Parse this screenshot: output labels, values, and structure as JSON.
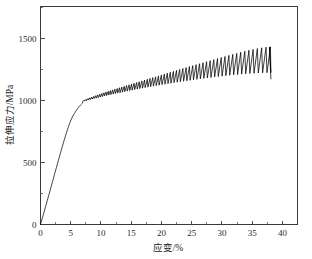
{
  "chart_data": {
    "type": "line",
    "title": "",
    "xlabel": "应变/%",
    "ylabel": "拉伸应力/MPa",
    "xlim": [
      0,
      42.5
    ],
    "ylim": [
      0,
      1760
    ],
    "xticks": [
      0,
      5,
      10,
      15,
      20,
      25,
      30,
      35,
      40
    ],
    "xticklabels": [
      "0",
      "5",
      "10",
      "15",
      "20",
      "25",
      "30",
      "35",
      "40"
    ],
    "xminorticks": [
      2.5,
      7.5,
      12.5,
      17.5,
      22.5,
      27.5,
      32.5,
      37.5
    ],
    "yticks": [
      0,
      500,
      1000,
      1500
    ],
    "yticklabels": [
      "0",
      "500",
      "1000",
      "1500"
    ],
    "grid": false,
    "legend": null,
    "series": [
      {
        "name": "tensile stress-strain curve",
        "description": "Elastic-plastic tensile curve with serrated (Portevin-Le Chatelier) flow in the plastic region, ending in fracture drop",
        "color": "#000000",
        "elastic_region": {
          "x": [
            0.0,
            0.5,
            1.0,
            1.5,
            2.0,
            2.5,
            3.0,
            3.5,
            4.0,
            4.5,
            5.0,
            5.4,
            5.8,
            6.2,
            6.6,
            7.0
          ],
          "y": [
            0,
            85,
            172,
            260,
            348,
            437,
            525,
            612,
            695,
            772,
            840,
            880,
            912,
            940,
            963,
            982
          ]
        },
        "serrated_envelope": {
          "x": [
            7.0,
            8.0,
            9.0,
            10.0,
            11.0,
            12.0,
            13.0,
            14.0,
            15.0,
            16.0,
            17.0,
            18.0,
            19.0,
            20.0,
            21.0,
            22.0,
            23.0,
            24.0,
            25.0,
            26.0,
            27.0,
            28.0,
            29.0,
            30.0,
            31.0,
            32.0,
            33.0,
            34.0,
            35.0,
            36.0,
            37.0,
            38.0
          ],
          "upper": [
            1000,
            1020,
            1038,
            1055,
            1072,
            1088,
            1103,
            1118,
            1133,
            1148,
            1163,
            1178,
            1192,
            1207,
            1222,
            1237,
            1252,
            1266,
            1280,
            1294,
            1308,
            1322,
            1336,
            1350,
            1363,
            1376,
            1389,
            1401,
            1412,
            1422,
            1430,
            1435
          ],
          "lower": [
            992,
            1006,
            1018,
            1030,
            1042,
            1053,
            1063,
            1073,
            1083,
            1093,
            1102,
            1111,
            1120,
            1128,
            1136,
            1144,
            1152,
            1159,
            1166,
            1173,
            1180,
            1186,
            1192,
            1198,
            1203,
            1208,
            1213,
            1217,
            1220,
            1223,
            1225,
            1226
          ]
        },
        "serration_period_strain": 0.42,
        "fracture": {
          "strain": 38.1,
          "stress_at_peak": 1432,
          "stress_after_drop": 1175
        },
        "key_values": {
          "yield_strength_MPa": 900,
          "ultimate_tensile_strength_MPa": 1435,
          "elongation_percent": 38.1,
          "serration_onset_strain_percent": 6.5
        }
      }
    ]
  },
  "axis": {
    "x_title": "应变/%",
    "y_title": "拉伸应力/MPa"
  }
}
